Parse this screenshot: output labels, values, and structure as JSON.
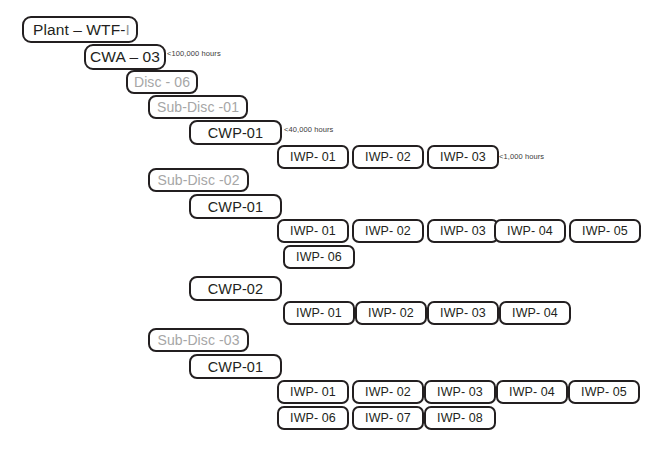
{
  "diagram": {
    "colors": {
      "border_dark": "#231f20",
      "text_dark": "#231f20",
      "text_grey": "#a6a6a6",
      "background": "#ffffff"
    },
    "nodes": [
      {
        "id": "plant",
        "label": "Plant – WTF-",
        "suffix": "I",
        "level": "plant",
        "x": 22,
        "y": 16,
        "w": 116,
        "h": 27
      },
      {
        "id": "cwa-03",
        "label": "CWA – 03",
        "level": "cwa",
        "x": 84,
        "y": 44,
        "w": 82,
        "h": 26
      },
      {
        "id": "disc-06",
        "label": "Disc - 06",
        "level": "disc",
        "x": 126,
        "y": 70,
        "w": 72,
        "h": 24
      },
      {
        "id": "sub-disc-01",
        "label": "Sub-Disc -01",
        "level": "subdisc",
        "x": 148,
        "y": 95,
        "w": 100,
        "h": 24
      },
      {
        "id": "cwp-01-a",
        "label": "CWP-01",
        "level": "cwp",
        "x": 189,
        "y": 120,
        "w": 93,
        "h": 25
      },
      {
        "id": "a-iwp-01",
        "label": "IWP- 01",
        "level": "iwp",
        "x": 277,
        "y": 145,
        "w": 72,
        "h": 24
      },
      {
        "id": "a-iwp-02",
        "label": "IWP- 02",
        "level": "iwp",
        "x": 352,
        "y": 145,
        "w": 72,
        "h": 24
      },
      {
        "id": "a-iwp-03",
        "label": "IWP- 03",
        "level": "iwp",
        "x": 427,
        "y": 145,
        "w": 72,
        "h": 24
      },
      {
        "id": "sub-disc-02",
        "label": "Sub-Disc -02",
        "level": "subdisc",
        "x": 148,
        "y": 168,
        "w": 101,
        "h": 24
      },
      {
        "id": "cwp-01-b",
        "label": "CWP-01",
        "level": "cwp",
        "x": 189,
        "y": 194,
        "w": 93,
        "h": 25
      },
      {
        "id": "b-iwp-01",
        "label": "IWP- 01",
        "level": "iwp",
        "x": 277,
        "y": 219,
        "w": 72,
        "h": 24
      },
      {
        "id": "b-iwp-02",
        "label": "IWP- 02",
        "level": "iwp",
        "x": 352,
        "y": 219,
        "w": 72,
        "h": 24
      },
      {
        "id": "b-iwp-03",
        "label": "IWP- 03",
        "level": "iwp",
        "x": 427,
        "y": 219,
        "w": 72,
        "h": 24
      },
      {
        "id": "b-iwp-04",
        "label": "IWP- 04",
        "level": "iwp",
        "x": 494,
        "y": 219,
        "w": 72,
        "h": 24
      },
      {
        "id": "b-iwp-05",
        "label": "IWP- 05",
        "level": "iwp",
        "x": 569,
        "y": 219,
        "w": 72,
        "h": 24
      },
      {
        "id": "b-iwp-06",
        "label": "IWP- 06",
        "level": "iwp",
        "x": 283,
        "y": 245,
        "w": 72,
        "h": 24
      },
      {
        "id": "cwp-02",
        "label": "CWP-02",
        "level": "cwp",
        "x": 189,
        "y": 276,
        "w": 93,
        "h": 25
      },
      {
        "id": "c-iwp-01",
        "label": "IWP- 01",
        "level": "iwp",
        "x": 283,
        "y": 301,
        "w": 72,
        "h": 24
      },
      {
        "id": "c-iwp-02",
        "label": "IWP- 02",
        "level": "iwp",
        "x": 355,
        "y": 301,
        "w": 72,
        "h": 24
      },
      {
        "id": "c-iwp-03",
        "label": "IWP- 03",
        "level": "iwp",
        "x": 427,
        "y": 301,
        "w": 72,
        "h": 24
      },
      {
        "id": "c-iwp-04",
        "label": "IWP- 04",
        "level": "iwp",
        "x": 499,
        "y": 301,
        "w": 72,
        "h": 24
      },
      {
        "id": "sub-disc-03",
        "label": "Sub-Disc -03",
        "level": "subdisc",
        "x": 148,
        "y": 328,
        "w": 101,
        "h": 24
      },
      {
        "id": "cwp-01-c",
        "label": "CWP-01",
        "level": "cwp",
        "x": 189,
        "y": 354,
        "w": 93,
        "h": 25
      },
      {
        "id": "d-iwp-01",
        "label": "IWP- 01",
        "level": "iwp",
        "x": 277,
        "y": 380,
        "w": 72,
        "h": 24
      },
      {
        "id": "d-iwp-02",
        "label": "IWP- 02",
        "level": "iwp",
        "x": 352,
        "y": 380,
        "w": 72,
        "h": 24
      },
      {
        "id": "d-iwp-03",
        "label": "IWP- 03",
        "level": "iwp",
        "x": 424,
        "y": 380,
        "w": 72,
        "h": 24
      },
      {
        "id": "d-iwp-04",
        "label": "IWP- 04",
        "level": "iwp",
        "x": 496,
        "y": 380,
        "w": 72,
        "h": 24
      },
      {
        "id": "d-iwp-05",
        "label": "IWP- 05",
        "level": "iwp",
        "x": 568,
        "y": 380,
        "w": 72,
        "h": 24
      },
      {
        "id": "d-iwp-06",
        "label": "IWP- 06",
        "level": "iwp",
        "x": 277,
        "y": 406,
        "w": 72,
        "h": 24
      },
      {
        "id": "d-iwp-07",
        "label": "IWP- 07",
        "level": "iwp",
        "x": 352,
        "y": 406,
        "w": 72,
        "h": 24
      },
      {
        "id": "d-iwp-08",
        "label": "IWP- 08",
        "level": "iwp",
        "x": 424,
        "y": 406,
        "w": 72,
        "h": 24
      }
    ],
    "annotations": [
      {
        "id": "annot-cwa",
        "text": "<100,000 hours",
        "x": 167,
        "y": 49
      },
      {
        "id": "annot-cwp",
        "text": "<40,000 hours",
        "x": 284,
        "y": 125
      },
      {
        "id": "annot-iwp",
        "text": "<1,000 hours",
        "x": 499,
        "y": 152
      }
    ]
  }
}
